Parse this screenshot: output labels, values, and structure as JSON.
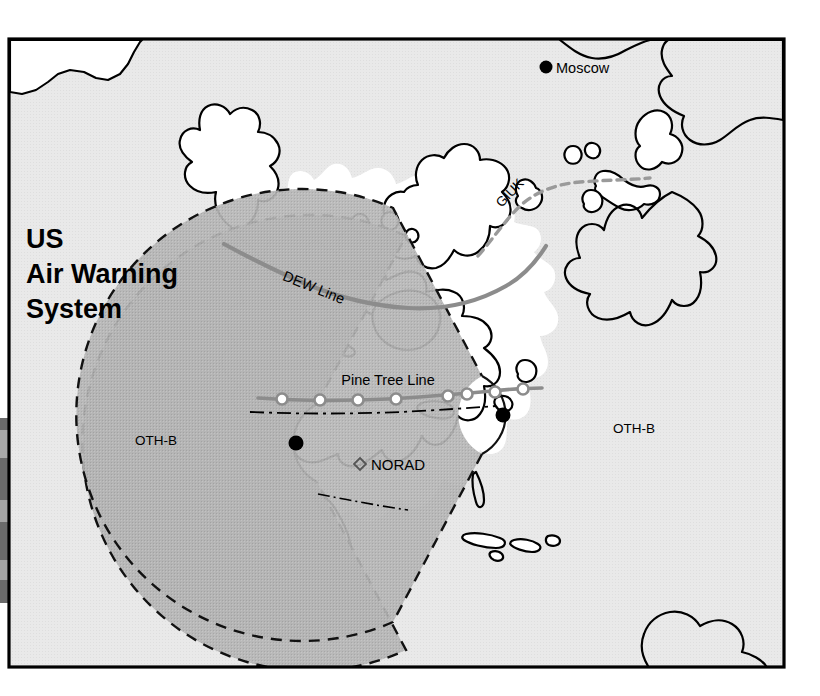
{
  "figure": {
    "title_lines": [
      "US",
      "Air Warning",
      "System"
    ],
    "title_full": "US Air Warning System",
    "frame": {
      "x": 8,
      "y": 38,
      "width": 777,
      "height": 630
    }
  },
  "colors": {
    "background_paper": "#ffffff",
    "ocean_fill": "#e6e6e6",
    "land_fill": "#ffffff",
    "othb_fill": "#b3b3b3",
    "outline": "#000000",
    "radar_line": "#8c8c8c",
    "giuk_line": "#9a9a9a",
    "text": "#000000",
    "frame": "#000000"
  },
  "legend_note": {
    "ocean": "Ocean / sea areas shown in light gray halftone",
    "land": "Land masses shown in white with black coastline outline",
    "othb": "OTH-B radar coverage sectors shown in medium gray with dashed boundary"
  },
  "map_labels": [
    {
      "id": "moscow",
      "text": "Moscow",
      "x": 556,
      "y": 71,
      "rotation": 0,
      "font_size": 14,
      "weight": "normal",
      "anchor": "start",
      "marker": "filled-dot"
    },
    {
      "id": "giuk",
      "text": "GIUK",
      "x": 513,
      "y": 196,
      "rotation": -46,
      "font_size": 13,
      "weight": "normal",
      "anchor": "middle",
      "marker": "none"
    },
    {
      "id": "dew-line",
      "text": "DEW  Line",
      "x": 312,
      "y": 290,
      "rotation": 22,
      "font_size": 14,
      "weight": "normal",
      "anchor": "middle",
      "marker": "none"
    },
    {
      "id": "pine-tree-line",
      "text": "Pine Tree    Line",
      "x": 388,
      "y": 385,
      "rotation": 0,
      "font_size": 14,
      "weight": "normal",
      "anchor": "middle",
      "marker": "none"
    },
    {
      "id": "othb-west",
      "text": "OTH-B",
      "x": 156,
      "y": 440,
      "rotation": 0,
      "font_size": 13,
      "weight": "normal",
      "anchor": "middle",
      "marker": "none"
    },
    {
      "id": "othb-east",
      "text": "OTH-B",
      "x": 634,
      "y": 428,
      "rotation": 0,
      "font_size": 13,
      "weight": "normal",
      "anchor": "middle",
      "marker": "none"
    },
    {
      "id": "norad",
      "text": "NORAD",
      "x": 369,
      "y": 469,
      "rotation": 0,
      "font_size": 15,
      "weight": "normal",
      "anchor": "start",
      "marker": "open-diamond"
    }
  ],
  "markers": {
    "moscow": {
      "x": 546,
      "y": 67,
      "type": "filled-dot",
      "r": 6
    },
    "norad": {
      "x": 360,
      "y": 464,
      "type": "open-diamond",
      "r": 5
    },
    "othb_west_site": {
      "x": 296,
      "y": 443,
      "type": "filled-dot",
      "r": 7
    },
    "othb_east_site": {
      "x": 503,
      "y": 415,
      "type": "filled-dot",
      "r": 7
    }
  },
  "othb_sectors": [
    {
      "id": "othb-west",
      "label": "OTH-B",
      "site_x": 296,
      "site_y": 443,
      "outer_radius": 228,
      "inner_radius": 44,
      "start_angle_deg": 61,
      "end_angle_deg": 299,
      "fill": "#b3b3b3",
      "boundary": "dashed"
    },
    {
      "id": "othb-east",
      "label": "OTH-B",
      "site_x": 503,
      "site_y": 415,
      "outer_radius": 226,
      "inner_radius": 44,
      "start_angle_deg": -119,
      "end_angle_deg": 119,
      "fill": "#b3b3b3",
      "boundary": "dashed"
    }
  ],
  "radar_lines": [
    {
      "id": "dew-line",
      "name": "DEW Line",
      "style": "solid-gray",
      "stations": 0,
      "description": "Distant Early Warning Line across northern Canada and Alaska"
    },
    {
      "id": "pine-tree-line",
      "name": "Pine Tree Line",
      "style": "solid-gray-with-open-circles",
      "stations": 8,
      "description": "Pine Tree Line across the southern Canada / US border"
    },
    {
      "id": "giuk",
      "name": "GIUK",
      "style": "dashed-gray",
      "stations": 0,
      "description": "Greenland-Iceland-United Kingdom gap barrier"
    }
  ],
  "pine_tree_stations": [
    {
      "x": 282,
      "y": 398
    },
    {
      "x": 320,
      "y": 399
    },
    {
      "x": 358,
      "y": 399
    },
    {
      "x": 396,
      "y": 398
    },
    {
      "x": 448,
      "y": 396
    },
    {
      "x": 466,
      "y": 394
    },
    {
      "x": 494,
      "y": 391
    },
    {
      "x": 522,
      "y": 389
    }
  ]
}
